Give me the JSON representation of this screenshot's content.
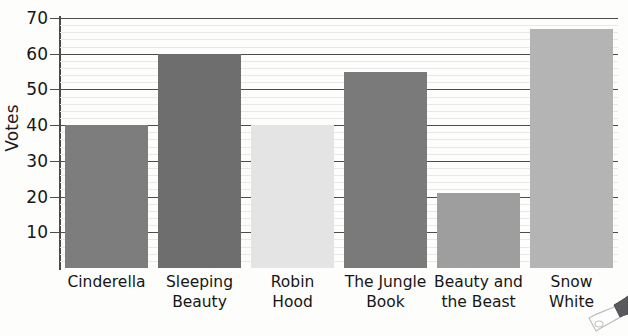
{
  "chart_data": {
    "type": "bar",
    "title": "",
    "xlabel": "",
    "ylabel": "Votes",
    "ylim": [
      0,
      70
    ],
    "ytick_step": 10,
    "minor_gridline_step": 2,
    "grid": true,
    "legend": "none",
    "categories": [
      "Cinderella",
      "Sleeping Beauty",
      "Robin Hood",
      "The Jungle Book",
      "Beauty and the Beast",
      "Snow White"
    ],
    "category_lines": [
      [
        "Cinderella"
      ],
      [
        "Sleeping",
        "Beauty"
      ],
      [
        "Robin",
        "Hood"
      ],
      [
        "The Jungle",
        "Book"
      ],
      [
        "Beauty and",
        "the Beast"
      ],
      [
        "Snow",
        "White"
      ]
    ],
    "values": [
      40,
      60,
      40,
      55,
      21,
      67
    ],
    "bar_colors": [
      "#7d7d7d",
      "#6e6e6e",
      "#e4e4e4",
      "#7a7a7a",
      "#9e9e9e",
      "#b4b4b4"
    ],
    "ytick_labels": [
      "10",
      "20",
      "30",
      "40",
      "50",
      "60",
      "70"
    ],
    "ytick_values": [
      10,
      20,
      30,
      40,
      50,
      60,
      70
    ]
  },
  "axis": {
    "y_title": "Votes",
    "axis_color": "#4a4a4a",
    "major_gridline_color": "#4c4c4c",
    "minor_gridline_color": "#e8e8ea"
  },
  "decoration": {
    "pencil_label": "pencil-tip-doodle"
  }
}
